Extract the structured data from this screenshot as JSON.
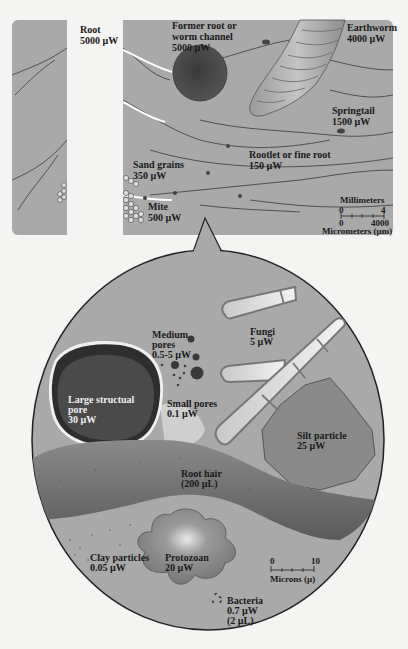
{
  "top_panel": {
    "labels": {
      "root": {
        "name": "Root",
        "value": "5000 µW"
      },
      "channel": {
        "name1": "Former root or",
        "name2": "worm channel",
        "value": "5000 µW"
      },
      "earthworm": {
        "name": "Earthworm",
        "value": "4000 µW"
      },
      "springtail": {
        "name": "Springtail",
        "value": "1500 µW"
      },
      "rootlet": {
        "name": "Rootlet or fine root",
        "value": "150 µW"
      },
      "sand": {
        "name": "Sand grains",
        "value": "350 µW"
      },
      "mite": {
        "name": "Mite",
        "value": "500 µW"
      }
    },
    "scale": {
      "top_title": "Millimeters",
      "top_min": "0",
      "top_max": "4",
      "bottom_min": "0",
      "bottom_max": "4000",
      "bottom_title": "Micrometers (µm)"
    }
  },
  "zoom_circle": {
    "labels": {
      "medium_pores": {
        "l1": "Medium",
        "l2": "pores",
        "value": "0.5-5 µW"
      },
      "fungi": {
        "name": "Fungi",
        "value": "5 µW"
      },
      "large_pore": {
        "l1": "Large structual",
        "l2": "pore",
        "value": "30 µW"
      },
      "small_pores": {
        "name": "Small pores",
        "value": "0.1 µW"
      },
      "silt": {
        "name": "Silt particle",
        "value": "25 µW"
      },
      "root_hair": {
        "name": "Root hair",
        "value": "(200 µL)"
      },
      "clay": {
        "name": "Clay particles",
        "value": "0.05 µW"
      },
      "protozoan": {
        "name": "Protozoan",
        "value": "20 µW"
      },
      "bacteria": {
        "name": "Bacteria",
        "value": "0.7 µW",
        "value2": "(2 µL)"
      }
    },
    "scale": {
      "min": "0",
      "max": "10",
      "title": "Microns (µ)"
    }
  },
  "colors": {
    "panel": "#a9a9a9",
    "dark_pore": "#4a4a4a",
    "root_hair": "#6e6e6e",
    "silt": "#8a8a8a",
    "fungi": "#d8d8d8"
  }
}
